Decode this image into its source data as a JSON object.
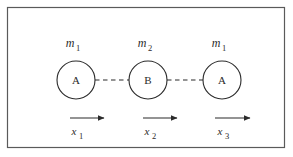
{
  "figure": {
    "type": "physics-diagram",
    "border_color": "#5a5a5a",
    "line_color": "#2b2b2b",
    "background_color": "#ffffff",
    "frame": {
      "x": 7,
      "y": 7,
      "width": 278,
      "height": 141
    }
  },
  "masses": [
    {
      "id": "mass-1",
      "letter": "A",
      "mass_label": "m",
      "mass_subscript": "1",
      "coord_label": "x",
      "coord_subscript": "1",
      "center_x": 76,
      "center_y": 80,
      "radius": 19
    },
    {
      "id": "mass-2",
      "letter": "B",
      "mass_label": "m",
      "mass_subscript": "2",
      "coord_label": "x",
      "coord_subscript": "2",
      "center_x": 148,
      "center_y": 80,
      "radius": 19
    },
    {
      "id": "mass-3",
      "letter": "A",
      "mass_label": "m",
      "mass_subscript": "1",
      "coord_label": "x",
      "coord_subscript": "3",
      "center_x": 222,
      "center_y": 80,
      "radius": 19
    }
  ],
  "connectors": [
    {
      "id": "connector-1-2",
      "from_x": 95,
      "to_x": 129,
      "y": 80
    },
    {
      "id": "connector-2-3",
      "from_x": 167,
      "to_x": 203,
      "y": 80
    }
  ],
  "arrows": [
    {
      "id": "arrow-x1",
      "start_x": 70,
      "end_x": 104,
      "y": 118
    },
    {
      "id": "arrow-x2",
      "start_x": 143,
      "end_x": 177,
      "y": 118
    },
    {
      "id": "arrow-x3",
      "start_x": 215,
      "end_x": 250,
      "y": 118
    }
  ]
}
